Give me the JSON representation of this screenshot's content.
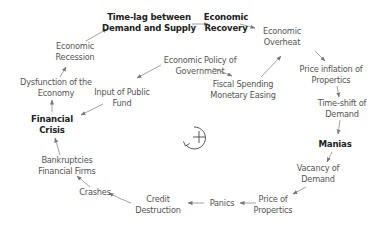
{
  "diagram": {
    "type": "causal-loop",
    "loop_polarity_symbol": "+",
    "nodes": [
      {
        "id": "time_lag",
        "lines": [
          "Time-lag between",
          "Demand and Supply"
        ],
        "bold": true,
        "x": 149,
        "y": 12
      },
      {
        "id": "economic_recovery",
        "lines": [
          "Economic",
          "Recovery"
        ],
        "bold": true,
        "x": 234,
        "y": 12
      },
      {
        "id": "economic_overheat",
        "lines": [
          "Economic",
          "Overheat"
        ],
        "bold": false,
        "x": 303,
        "y": 25
      },
      {
        "id": "price_inflation",
        "lines": [
          "Price inflation of",
          "Propertics"
        ],
        "bold": false,
        "x": 331,
        "y": 65
      },
      {
        "id": "time_shift",
        "lines": [
          "Time-shift of",
          "Demand"
        ],
        "bold": false,
        "x": 341,
        "y": 98
      },
      {
        "id": "manias",
        "lines": [
          "Manias"
        ],
        "bold": true,
        "x": 335,
        "y": 139
      },
      {
        "id": "vacancy",
        "lines": [
          "Vacancy of",
          "Demand"
        ],
        "bold": false,
        "x": 318,
        "y": 165
      },
      {
        "id": "price_of_properties",
        "lines": [
          "Price of",
          "Propertics"
        ],
        "bold": false,
        "x": 273,
        "y": 194
      },
      {
        "id": "panics",
        "lines": [
          "Panics"
        ],
        "bold": false,
        "x": 211,
        "y": 199
      },
      {
        "id": "credit_destruction",
        "lines": [
          "Credit",
          "Destruction"
        ],
        "bold": false,
        "x": 158,
        "y": 194
      },
      {
        "id": "crashes",
        "lines": [
          "Crashes"
        ],
        "bold": false,
        "x": 95,
        "y": 187
      },
      {
        "id": "bankruptcies",
        "lines": [
          "Bankruptcies",
          "Financial Firms"
        ],
        "bold": false,
        "x": 67,
        "y": 154
      },
      {
        "id": "financial_crisis",
        "lines": [
          "Financial",
          "Crisis"
        ],
        "bold": true,
        "x": 52,
        "y": 114
      },
      {
        "id": "dysfunction",
        "lines": [
          "Dysfunction of the",
          "Economy"
        ],
        "bold": false,
        "x": 56,
        "y": 77
      },
      {
        "id": "economic_recession",
        "lines": [
          "Economic",
          "Recession"
        ],
        "bold": false,
        "x": 75,
        "y": 41
      },
      {
        "id": "economic_policy",
        "lines": [
          "Economic Policy of",
          "Government"
        ],
        "bold": false,
        "x": 200,
        "y": 55
      },
      {
        "id": "input_public_fund",
        "lines": [
          "Input of Public",
          "Fund"
        ],
        "bold": false,
        "x": 122,
        "y": 87
      },
      {
        "id": "fiscal_spending",
        "lines": [
          "Fiscal Spending",
          "Monetary Easing"
        ],
        "bold": false,
        "x": 247,
        "y": 80
      }
    ],
    "edges": [
      {
        "from": "time_lag",
        "to": "economic_recovery"
      },
      {
        "from": "economic_recovery",
        "to": "economic_overheat"
      },
      {
        "from": "economic_overheat",
        "to": "price_inflation"
      },
      {
        "from": "price_inflation",
        "to": "time_shift"
      },
      {
        "from": "time_shift",
        "to": "manias"
      },
      {
        "from": "manias",
        "to": "vacancy"
      },
      {
        "from": "vacancy",
        "to": "price_of_properties"
      },
      {
        "from": "price_of_properties",
        "to": "panics"
      },
      {
        "from": "panics",
        "to": "credit_destruction"
      },
      {
        "from": "credit_destruction",
        "to": "crashes"
      },
      {
        "from": "crashes",
        "to": "bankruptcies"
      },
      {
        "from": "bankruptcies",
        "to": "financial_crisis"
      },
      {
        "from": "financial_crisis",
        "to": "dysfunction"
      },
      {
        "from": "dysfunction",
        "to": "economic_recession"
      },
      {
        "from": "economic_recession",
        "to": "time_lag"
      },
      {
        "from": "economic_policy",
        "to": "input_public_fund"
      },
      {
        "from": "economic_policy",
        "to": "fiscal_spending"
      },
      {
        "from": "input_public_fund",
        "to": "financial_crisis"
      },
      {
        "from": "fiscal_spending",
        "to": "economic_overheat"
      }
    ],
    "colors": {
      "arrow": "#777777",
      "text_bold": "#222222",
      "text_normal": "#555555"
    }
  }
}
